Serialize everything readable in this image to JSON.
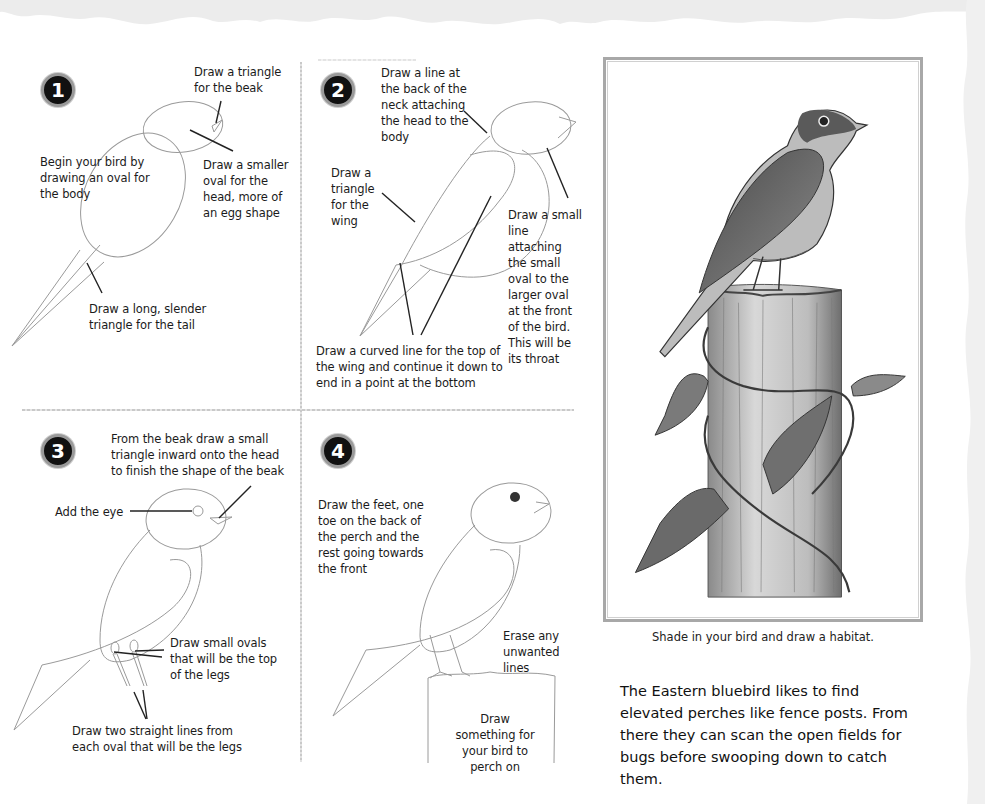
{
  "page": {
    "type": "drawing tutorial",
    "subject": "Eastern bluebird"
  },
  "steps": [
    {
      "number": "1",
      "notes": [
        {
          "id": "beak",
          "text": "Draw a triangle for the beak"
        },
        {
          "id": "body",
          "text": "Begin your bird by drawing an oval for the body"
        },
        {
          "id": "head",
          "text": "Draw a smaller oval for the head, more of an egg shape"
        },
        {
          "id": "tail",
          "text": "Draw a long, slender triangle for the tail"
        }
      ]
    },
    {
      "number": "2",
      "notes": [
        {
          "id": "neck",
          "text": "Draw a line at the back of the neck attaching the head to the body"
        },
        {
          "id": "wing",
          "text": "Draw a triangle for the wing"
        },
        {
          "id": "throat",
          "text": "Draw a small line attaching the small oval to the larger oval at the front of the bird. This will be its throat"
        },
        {
          "id": "curve",
          "text": "Draw a curved line for the top of the wing and continue it down to end in a point at the bottom"
        }
      ]
    },
    {
      "number": "3",
      "notes": [
        {
          "id": "beak2",
          "text": "From the beak draw a small triangle inward onto the head to finish the shape of the beak"
        },
        {
          "id": "eye",
          "text": "Add the eye"
        },
        {
          "id": "ovals",
          "text": "Draw small ovals that will be the top of the legs"
        },
        {
          "id": "legs",
          "text": "Draw two straight lines from each oval that will be the legs"
        }
      ]
    },
    {
      "number": "4",
      "notes": [
        {
          "id": "feet",
          "text": "Draw the feet, one toe on the back of the perch and the rest going towards the front"
        },
        {
          "id": "erase",
          "text": "Erase any unwanted lines"
        },
        {
          "id": "perch",
          "text": "Draw something for your bird to perch on"
        }
      ]
    }
  ],
  "illustration": {
    "description": "Shaded pencil drawing of an Eastern bluebird perched on a wooden post wrapped with a leafy vine",
    "caption": "Shade in your bird and draw a habitat."
  },
  "fact": "The Eastern bluebird likes to find elevated perches like fence posts. From there they can scan the open fields for bugs before swooping down to catch them.",
  "colors": {
    "paper": "#ffffff",
    "ink": "#1a1a1a",
    "pencil": "#9a9a9a",
    "badge": "#111111",
    "frame": "#a8a8a8"
  }
}
